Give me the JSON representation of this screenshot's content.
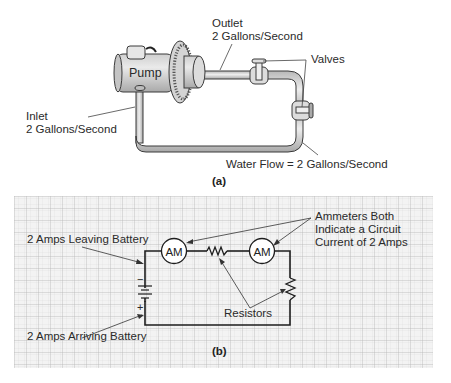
{
  "figure_a": {
    "caption": "(a)",
    "pump_label": "Pump",
    "outlet_label_line1": "Outlet",
    "outlet_label_line2": "2 Gallons/Second",
    "inlet_label_line1": "Inlet",
    "inlet_label_line2": "2 Gallons/Second",
    "valves_label": "Valves",
    "flow_label": "Water Flow = 2 Gallons/Second"
  },
  "figure_b": {
    "caption": "(b)",
    "leaving_label": "2 Amps Leaving Battery",
    "arriving_label": "2 Amps Arriving Battery",
    "ammeter_label_line1": "Ammeters Both",
    "ammeter_label_line2": "Indicate a Circuit",
    "ammeter_label_line3": "Current of 2 Amps",
    "ammeter_1": "AM",
    "ammeter_2": "AM",
    "resistors_label": "Resistors",
    "battery_negative": "−",
    "battery_positive": "+"
  },
  "colors": {
    "pipe_fill": "#d9d9d9",
    "pipe_stroke": "#3a3a3a",
    "grid_major": "#b9b9b9",
    "grid_minor": "#dcdcdc",
    "grid_bg": "#f2f2f2"
  }
}
